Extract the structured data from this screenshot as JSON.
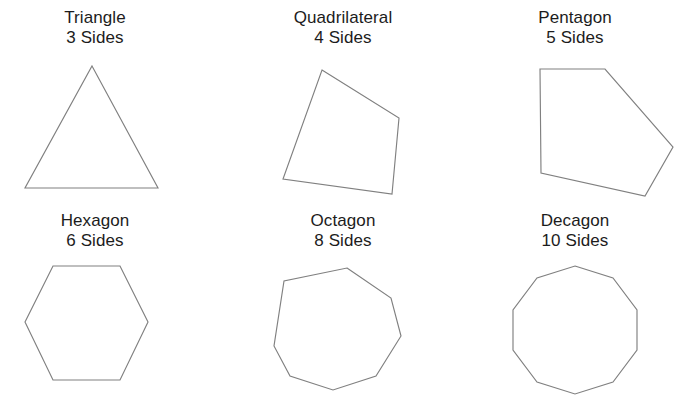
{
  "page": {
    "background_color": "#ffffff",
    "stroke_color": "#808080",
    "fill_color": "#ffffff",
    "text_color": "#1c1c1c"
  },
  "chart_data": {
    "type": "diagram",
    "subtitle": "",
    "xlabel": "",
    "ylabel": "",
    "grid": false,
    "legend": "none",
    "layout": {
      "rows": 2,
      "cols": 3
    },
    "categories": [
      "Triangle",
      "Quadrilateral",
      "Pentagon",
      "Hexagon",
      "Octagon",
      "Decagon"
    ],
    "values": [
      3,
      4,
      5,
      6,
      8,
      10
    ],
    "series": [
      {
        "name": "Number of Sides",
        "values": [
          3,
          4,
          5,
          6,
          8,
          10
        ]
      }
    ],
    "annotations": [
      "Triangle 3 Sides",
      "Quadrilateral 4 Sides",
      "Pentagon 5 Sides",
      "Hexagon 6 Sides",
      "Octagon 8 Sides",
      "Decagon 10 Sides"
    ]
  },
  "shapes": [
    {
      "id": "triangle",
      "name": "Triangle",
      "sides_label": "3 Sides",
      "sides_count": 3,
      "row": 0,
      "col": 0,
      "regular": true,
      "points": "92,66 158,188 25,188"
    },
    {
      "id": "quadrilateral",
      "name": "Quadrilateral",
      "sides_label": "4 Sides",
      "sides_count": 4,
      "row": 0,
      "col": 1,
      "regular": false,
      "points": "90,70 167,118 160,194 51,179"
    },
    {
      "id": "pentagon",
      "name": "Pentagon",
      "sides_label": "5 Sides",
      "sides_count": 5,
      "row": 0,
      "col": 2,
      "regular": false,
      "points": "76,69 141,69 209,147 181,196 77,173"
    },
    {
      "id": "hexagon",
      "name": "Hexagon",
      "sides_label": "6 Sides",
      "sides_count": 6,
      "row": 1,
      "col": 0,
      "regular": true,
      "points": "53,63 120,63 148,119 120,177 53,177 25,119"
    },
    {
      "id": "octagon",
      "name": "Octagon",
      "sides_label": "8 Sides",
      "sides_count": 8,
      "row": 1,
      "col": 1,
      "regular": true,
      "points": "115,65 159,95 169,133 144,173 101,187 58,173 42,143 52,78"
    },
    {
      "id": "decagon",
      "name": "Decagon",
      "sides_label": "10 Sides",
      "sides_count": 10,
      "row": 1,
      "col": 2,
      "regular": true,
      "points": "111,63 149,75 173,107 173,147 149,179 111,191 73,179 49,147 49,107 73,75"
    }
  ]
}
